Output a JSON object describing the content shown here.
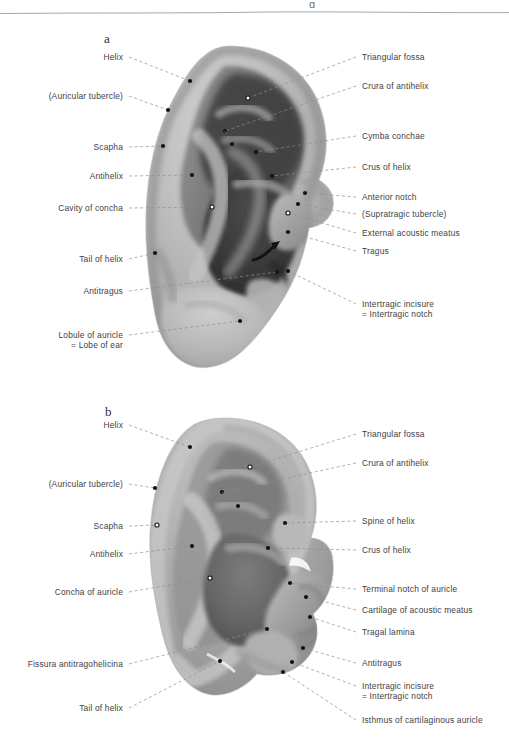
{
  "page": {
    "header_glyph": "g",
    "background_color": "#ffffff",
    "text_color": "#414145",
    "rule_color": "#9a9a9f"
  },
  "panels": [
    {
      "id": "a",
      "letter": "a",
      "caption": "Surface anatomy of the right auricle",
      "letter_x": 104,
      "letter_y": 31,
      "labels_left": [
        {
          "name": "helix",
          "text": "Helix",
          "x": 123,
          "y": 52,
          "dot": [
            190,
            81
          ],
          "dot_fill": "dark"
        },
        {
          "name": "auricular-tubercle",
          "text": "(Auricular tubercle)",
          "x": 123,
          "y": 91,
          "dot": [
            168,
            110
          ],
          "dot_fill": "dark"
        },
        {
          "name": "scapha",
          "text": "Scapha",
          "x": 123,
          "y": 142,
          "dot": [
            163,
            146
          ],
          "dot_fill": "dark"
        },
        {
          "name": "antihelix",
          "text": "Antihelix",
          "x": 123,
          "y": 171,
          "dot": [
            192,
            175
          ],
          "dot_fill": "dark"
        },
        {
          "name": "cavity-of-concha",
          "text": "Cavity of concha",
          "x": 123,
          "y": 203,
          "dot": [
            212,
            207
          ],
          "dot_fill": "light"
        },
        {
          "name": "tail-of-helix",
          "text": "Tail of helix",
          "x": 123,
          "y": 254,
          "dot": [
            155,
            253
          ],
          "dot_fill": "dark"
        },
        {
          "name": "antitragus",
          "text": "Antitragus",
          "x": 123,
          "y": 286,
          "dot": [
            277,
            272
          ],
          "dot_fill": "dark"
        },
        {
          "name": "lobule-of-auricle",
          "text": "Lobule of auricle",
          "text2": "= Lobe of ear",
          "x": 123,
          "y": 330,
          "dot": [
            240,
            321
          ],
          "dot_fill": "dark"
        }
      ],
      "labels_right": [
        {
          "name": "triangular-fossa",
          "text": "Triangular fossa",
          "x": 362,
          "y": 52,
          "dot": [
            248,
            98
          ],
          "dot_fill": "light"
        },
        {
          "name": "crura-of-antihelix",
          "text": "Crura of antihelix",
          "x": 362,
          "y": 81,
          "dot": [
            225,
            131
          ],
          "dot_fill": "dark"
        },
        {
          "name": "cymba-conchae",
          "text": "Cymba conchae",
          "x": 362,
          "y": 131,
          "dot": [
            256,
            152
          ],
          "dot_fill": "dark"
        },
        {
          "name": "crus-of-helix",
          "text": "Crus of helix",
          "x": 362,
          "y": 162,
          "dot": [
            272,
            176
          ],
          "dot_fill": "dark"
        },
        {
          "name": "anterior-notch",
          "text": "Anterior notch",
          "x": 362,
          "y": 192,
          "dot": [
            305,
            193
          ],
          "dot_fill": "dark"
        },
        {
          "name": "supratragic-tubercle",
          "text": "(Supratragic tubercle)",
          "x": 362,
          "y": 209,
          "dot": [
            298,
            204
          ],
          "dot_fill": "dark"
        },
        {
          "name": "external-acoustic-meatus",
          "text": "External acoustic meatus",
          "x": 362,
          "y": 228,
          "dot": [
            288,
            213
          ],
          "dot_fill": "light"
        },
        {
          "name": "tragus",
          "text": "Tragus",
          "x": 362,
          "y": 246,
          "dot": [
            288,
            232
          ],
          "dot_fill": "dark"
        },
        {
          "name": "intertragic-incisure",
          "text": "Intertragic incisure",
          "text2": "= Intertragic notch",
          "x": 362,
          "y": 299,
          "dot": [
            288,
            271
          ],
          "dot_fill": "dark"
        }
      ],
      "inner_connector": {
        "from": [
          225,
          131
        ],
        "to": [
          232,
          144
        ]
      },
      "arrow": {
        "name": "meatus-arrow",
        "from": [
          253,
          260
        ],
        "to": [
          280,
          241
        ]
      }
    },
    {
      "id": "b",
      "letter": "b",
      "caption": "Cartilage of the right auricle",
      "letter_x": 105,
      "letter_y": 404,
      "labels_left": [
        {
          "name": "helix",
          "text": "Helix",
          "x": 123,
          "y": 420,
          "dot": [
            190,
            447
          ],
          "dot_fill": "dark"
        },
        {
          "name": "auricular-tubercle",
          "text": "(Auricular tubercle)",
          "x": 123,
          "y": 479,
          "dot": [
            155,
            488
          ],
          "dot_fill": "dark"
        },
        {
          "name": "scapha",
          "text": "Scapha",
          "x": 123,
          "y": 521,
          "dot": [
            157,
            525
          ],
          "dot_fill": "light"
        },
        {
          "name": "antihelix",
          "text": "Antihelix",
          "x": 123,
          "y": 549,
          "dot": [
            192,
            546
          ],
          "dot_fill": "dark"
        },
        {
          "name": "concha-of-auricle",
          "text": "Concha of auricle",
          "x": 123,
          "y": 587,
          "dot": [
            210,
            578
          ],
          "dot_fill": "light"
        },
        {
          "name": "fissura-antitragohelicina",
          "text": "Fissura antitragohelicina",
          "x": 123,
          "y": 659,
          "dot": [
            267,
            629
          ],
          "dot_fill": "dark"
        },
        {
          "name": "tail-of-helix",
          "text": "Tail of helix",
          "x": 123,
          "y": 703,
          "dot": [
            220,
            661
          ],
          "dot_fill": "dark"
        }
      ],
      "labels_right": [
        {
          "name": "triangular-fossa",
          "text": "Triangular fossa",
          "x": 362,
          "y": 429,
          "dot": [
            250,
            467
          ],
          "dot_fill": "light"
        },
        {
          "name": "crura-of-antihelix",
          "text": "Crura of antihelix",
          "x": 362,
          "y": 458,
          "dot": [
            222,
            492
          ],
          "dot_fill": "dark"
        },
        {
          "name": "spine-of-helix",
          "text": "Spine of helix",
          "x": 362,
          "y": 516,
          "dot": [
            285,
            523
          ],
          "dot_fill": "dark"
        },
        {
          "name": "crus-of-helix",
          "text": "Crus of helix",
          "x": 362,
          "y": 545,
          "dot": [
            268,
            548
          ],
          "dot_fill": "dark"
        },
        {
          "name": "terminal-notch-of-auricle",
          "text": "Terminal notch of auricle",
          "x": 362,
          "y": 584,
          "dot": [
            290,
            583
          ],
          "dot_fill": "dark"
        },
        {
          "name": "cartilage-of-acoustic-meatus",
          "text": "Cartilage of acoustic meatus",
          "x": 362,
          "y": 605,
          "dot": [
            306,
            597
          ],
          "dot_fill": "dark"
        },
        {
          "name": "tragal-lamina",
          "text": "Tragal lamina",
          "x": 362,
          "y": 627,
          "dot": [
            310,
            617
          ],
          "dot_fill": "dark"
        },
        {
          "name": "antitragus",
          "text": "Antitragus",
          "x": 362,
          "y": 658,
          "dot": [
            303,
            648
          ],
          "dot_fill": "dark"
        },
        {
          "name": "intertragic-incisure",
          "text": "Intertragic incisure",
          "text2": "= Intertragic notch",
          "x": 362,
          "y": 681,
          "dot": [
            292,
            662
          ],
          "dot_fill": "dark"
        },
        {
          "name": "isthmus-of-cartilaginous-auricle",
          "text": "Isthmus of cartilaginous auricle",
          "x": 362,
          "y": 715,
          "dot": [
            283,
            672
          ],
          "dot_fill": "dark"
        }
      ],
      "inner_connector": {
        "from": [
          222,
          492
        ],
        "to": [
          238,
          506
        ]
      }
    }
  ],
  "style": {
    "leader_color": "#8d8d93",
    "dot_dark": "#141416",
    "dot_light": "#ffffff",
    "dot_light_ring": "#141416",
    "ear_light": "#c8c8c8",
    "ear_mid": "#9a9a9a",
    "ear_dark": "#5e5e5e",
    "ear_deep": "#3a3a3a"
  }
}
